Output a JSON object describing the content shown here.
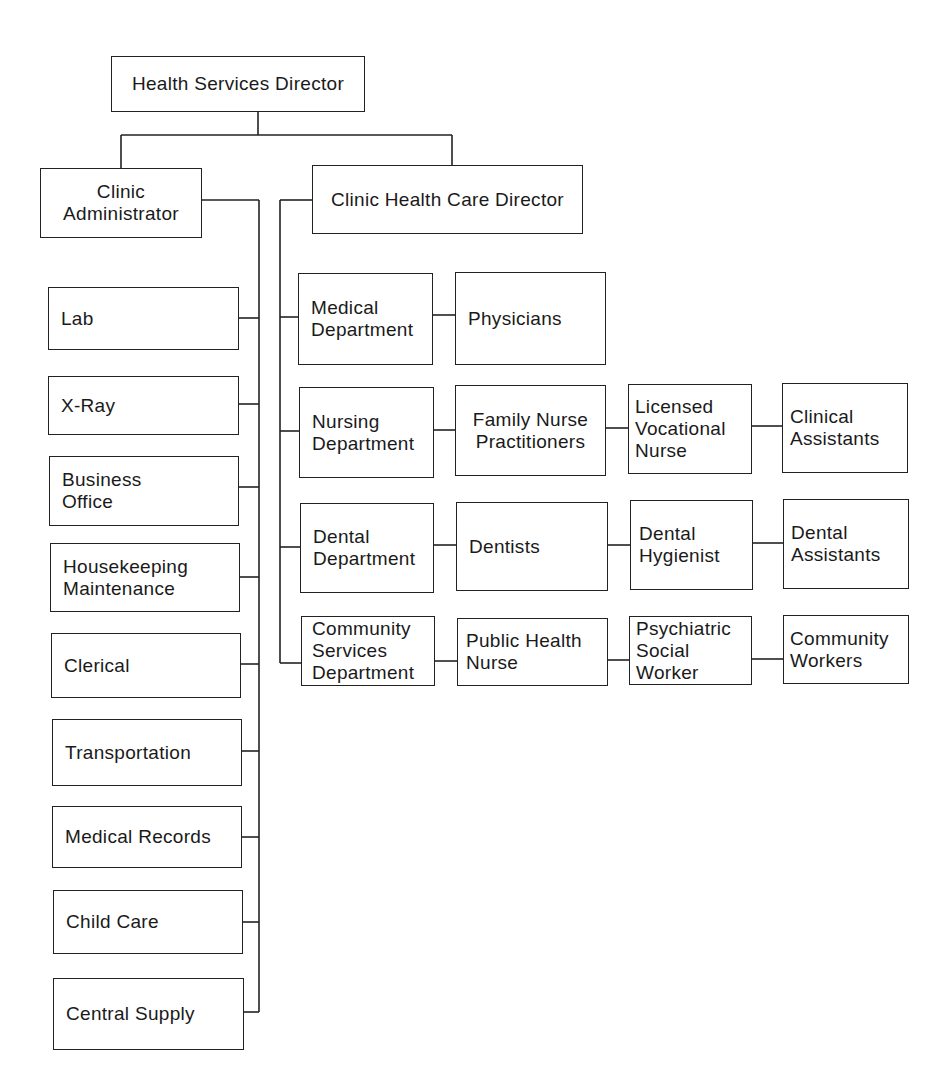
{
  "chart": {
    "top": {
      "id": "hsd",
      "label": "Health Services Director"
    },
    "level2": [
      {
        "id": "ca",
        "label": "Clinic\nAdministrator"
      },
      {
        "id": "chcd",
        "label": "Clinic Health Care Director"
      }
    ],
    "administrator_units": [
      {
        "id": "lab",
        "label": "Lab"
      },
      {
        "id": "xray",
        "label": "X-Ray"
      },
      {
        "id": "bo",
        "label": "Business\nOffice"
      },
      {
        "id": "hk",
        "label": "Housekeeping\nMaintenance"
      },
      {
        "id": "cler",
        "label": "Clerical"
      },
      {
        "id": "trans",
        "label": "Transportation"
      },
      {
        "id": "mr",
        "label": "Medical Records"
      },
      {
        "id": "cc",
        "label": "Child Care"
      },
      {
        "id": "cs",
        "label": "Central Supply"
      }
    ],
    "departments": [
      {
        "id": "med",
        "label": "Medical\nDepartment",
        "chain": [
          "Physicians"
        ]
      },
      {
        "id": "nurs",
        "label": "Nursing\nDepartment",
        "chain": [
          "Family Nurse\nPractitioners",
          "Licensed\nVocational\nNurse",
          "Clinical\nAssistants"
        ]
      },
      {
        "id": "dent",
        "label": "Dental\nDepartment",
        "chain": [
          "Dentists",
          "Dental\nHygienist",
          "Dental\nAssistants"
        ]
      },
      {
        "id": "comm",
        "label": "Community\nServices\nDepartment",
        "chain": [
          "Public Health\nNurse",
          "Psychiatric\nSocial\nWorker",
          "Community\nWorkers"
        ]
      }
    ]
  },
  "colors": {
    "line": "#222222",
    "background": "#ffffff",
    "text": "#1a1a1a"
  }
}
